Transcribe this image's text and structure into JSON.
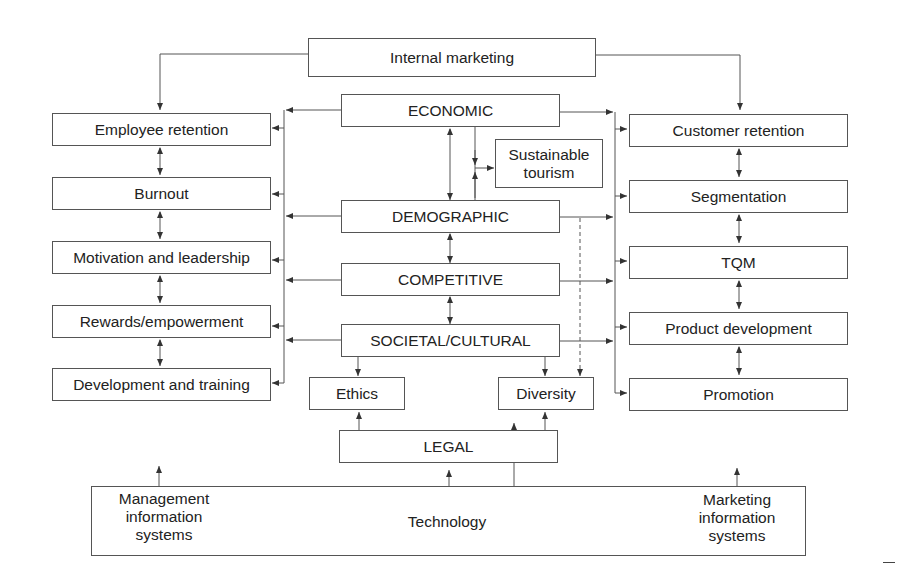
{
  "diagram": {
    "top": {
      "internal_marketing": "Internal marketing"
    },
    "environment": {
      "economic": "ECONOMIC",
      "demographic": "DEMOGRAPHIC",
      "competitive": "COMPETITIVE",
      "societal_cultural": "SOCIETAL/CULTURAL",
      "legal": "LEGAL"
    },
    "side_issues": {
      "sustainable_tourism": "Sustainable\ntourism",
      "ethics": "Ethics",
      "diversity": "Diversity"
    },
    "left_column": [
      "Employee retention",
      "Burnout",
      "Motivation and leadership",
      "Rewards/empowerment",
      "Development and training"
    ],
    "right_column": [
      "Customer retention",
      "Segmentation",
      "TQM",
      "Product development",
      "Promotion"
    ],
    "technology": {
      "label": "Technology",
      "mis": "Management\ninformation\nsystems",
      "mkis": "Marketing\ninformation\nsystems"
    },
    "colors": {
      "line": "#555555",
      "text": "#222222",
      "background": "#ffffff"
    }
  }
}
